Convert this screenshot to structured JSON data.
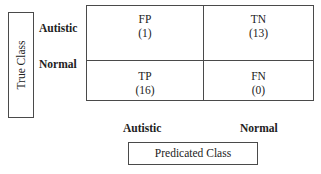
{
  "chart_data": {
    "type": "table",
    "ylabel": "True Class",
    "xlabel": "Predicated Class",
    "row_labels": [
      "Autistic",
      "Normal"
    ],
    "col_labels": [
      "Autistic",
      "Normal"
    ],
    "cells": [
      [
        {
          "abbr": "FP",
          "count": "(1)",
          "value": 1
        },
        {
          "abbr": "TN",
          "count": "(13)",
          "value": 13
        }
      ],
      [
        {
          "abbr": "TP",
          "count": "(16)",
          "value": 16
        },
        {
          "abbr": "FN",
          "count": "(0)",
          "value": 0
        }
      ]
    ]
  },
  "axes": {
    "y_title": "True Class",
    "x_title": "Predicated Class",
    "rows": [
      "Autistic",
      "Normal"
    ],
    "cols": [
      "Autistic",
      "Normal"
    ]
  }
}
